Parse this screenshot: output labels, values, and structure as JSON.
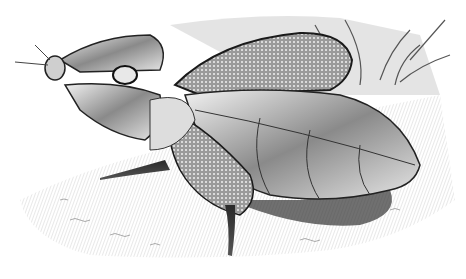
{
  "image": {
    "subject": "Engraving illustration of a leaf insect on the ground",
    "style": "monochrome wood engraving",
    "palette": {
      "paper": "#ffffff",
      "ink_dark": "#1a1a1a",
      "ink_mid": "#6e6e6e",
      "ink_light": "#bdbdbd"
    }
  }
}
